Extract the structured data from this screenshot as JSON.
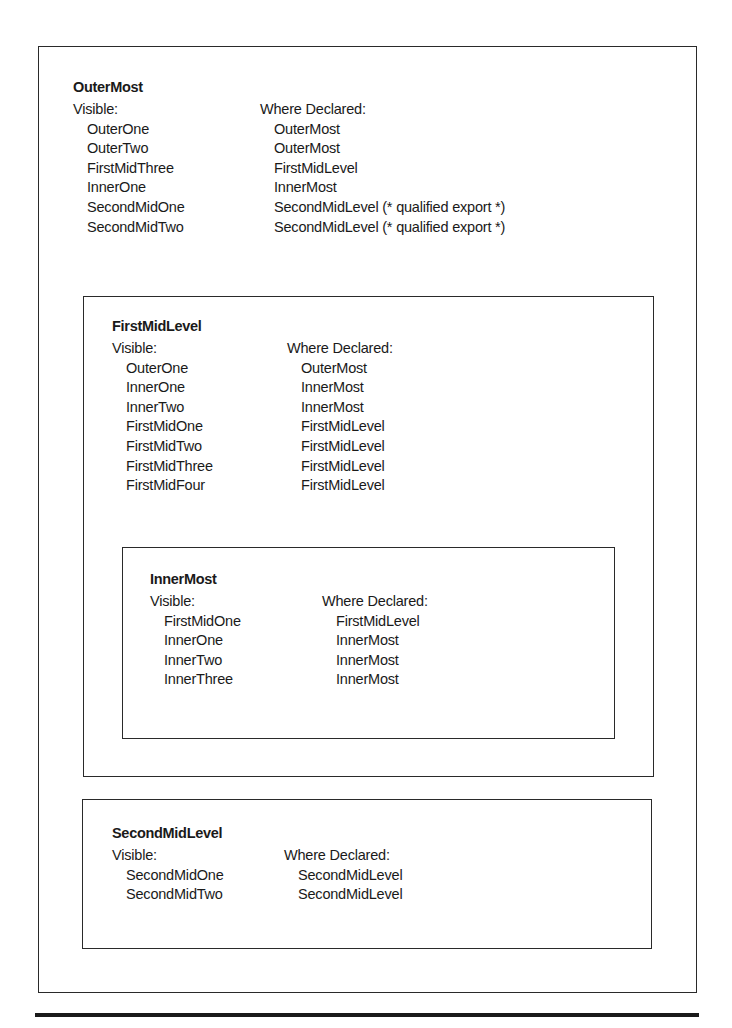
{
  "figure": {
    "scopes": {
      "outer_most": {
        "title": "OuterMost",
        "visible_header": "Visible:",
        "declared_header": "Where Declared:",
        "rows": [
          {
            "visible": "OuterOne",
            "declared": "OuterMost"
          },
          {
            "visible": "OuterTwo",
            "declared": "OuterMost"
          },
          {
            "visible": "FirstMidThree",
            "declared": "FirstMidLevel"
          },
          {
            "visible": "InnerOne",
            "declared": "InnerMost"
          },
          {
            "visible": "SecondMidOne",
            "declared": "SecondMidLevel (* qualified export *)"
          },
          {
            "visible": "SecondMidTwo",
            "declared": "SecondMidLevel (* qualified export *)"
          }
        ]
      },
      "first_mid_level": {
        "title": "FirstMidLevel",
        "visible_header": "Visible:",
        "declared_header": "Where Declared:",
        "rows": [
          {
            "visible": "OuterOne",
            "declared": "OuterMost"
          },
          {
            "visible": "InnerOne",
            "declared": "InnerMost"
          },
          {
            "visible": "InnerTwo",
            "declared": "InnerMost"
          },
          {
            "visible": "FirstMidOne",
            "declared": "FirstMidLevel"
          },
          {
            "visible": "FirstMidTwo",
            "declared": "FirstMidLevel"
          },
          {
            "visible": "FirstMidThree",
            "declared": "FirstMidLevel"
          },
          {
            "visible": "FirstMidFour",
            "declared": "FirstMidLevel"
          }
        ]
      },
      "inner_most": {
        "title": "InnerMost",
        "visible_header": "Visible:",
        "declared_header": "Where Declared:",
        "rows": [
          {
            "visible": "FirstMidOne",
            "declared": "FirstMidLevel"
          },
          {
            "visible": "InnerOne",
            "declared": "InnerMost"
          },
          {
            "visible": "InnerTwo",
            "declared": "InnerMost"
          },
          {
            "visible": "InnerThree",
            "declared": "InnerMost"
          }
        ]
      },
      "second_mid_level": {
        "title": "SecondMidLevel",
        "visible_header": "Visible:",
        "declared_header": "Where Declared:",
        "rows": [
          {
            "visible": "SecondMidOne",
            "declared": "SecondMidLevel"
          },
          {
            "visible": "SecondMidTwo",
            "declared": "SecondMidLevel"
          }
        ]
      }
    },
    "colors": {
      "ink": "#1a1a1a",
      "border": "#2a2a2a",
      "background": "#ffffff"
    }
  }
}
